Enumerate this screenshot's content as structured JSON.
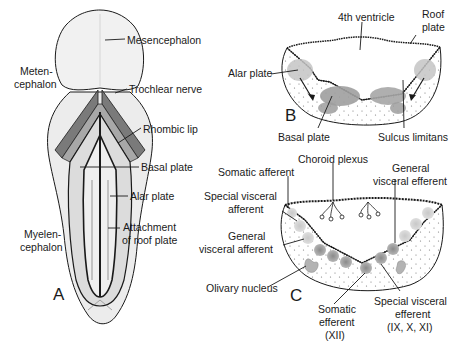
{
  "figure": {
    "panels": [
      {
        "id": "A",
        "letter": "A",
        "labels": {
          "mesencephalon": "Mesencephalon",
          "metencephalon_1": "Meten-",
          "metencephalon_2": "cephalon",
          "trochlear_nerve": "Trochlear nerve",
          "rhombic_lip": "Rhombic lip",
          "basal_plate": "Basal plate",
          "alar_plate": "Alar plate",
          "attachment_1": "Attachment",
          "attachment_2": "of roof plate",
          "myelencephalon_1": "Myelen-",
          "myelencephalon_2": "cephalon"
        }
      },
      {
        "id": "B",
        "letter": "B",
        "labels": {
          "fourth_ventricle": "4th ventricle",
          "roof_plate_1": "Roof",
          "roof_plate_2": "plate",
          "alar_plate": "Alar plate",
          "basal_plate": "Basal plate",
          "sulcus_limitans": "Sulcus limitans"
        }
      },
      {
        "id": "C",
        "letter": "C",
        "labels": {
          "choroid_plexus": "Choroid plexus",
          "somatic_afferent": "Somatic afferent",
          "special_visceral_afferent_1": "Special visceral",
          "special_visceral_afferent_2": "afferent",
          "general_visceral_afferent_1": "General",
          "general_visceral_afferent_2": "visceral afferent",
          "olivary_nucleus": "Olivary nucleus",
          "general_visceral_efferent_1": "General",
          "general_visceral_efferent_2": "visceral efferent",
          "somatic_efferent_1": "Somatic",
          "somatic_efferent_2": "efferent",
          "somatic_efferent_3": "(XII)",
          "special_visceral_efferent_1": "Special visceral",
          "special_visceral_efferent_2": "efferent",
          "special_visceral_efferent_3": "(IX, X, XI)"
        }
      }
    ],
    "colors": {
      "outline": "#1a1a1a",
      "tissue_light": "#ececec",
      "tissue_mid": "#bdbdbd",
      "tissue_dark": "#7a7a7a",
      "nucleus": "#9a9a9a"
    }
  }
}
